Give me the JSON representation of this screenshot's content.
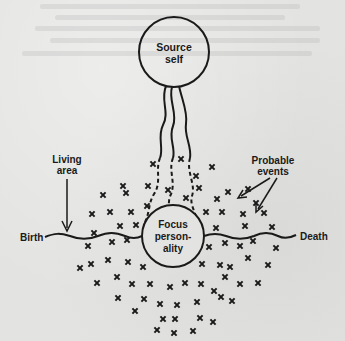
{
  "diagram": {
    "nodes": {
      "source": {
        "line1": "Source",
        "line2": "self"
      },
      "focus": {
        "line1": "Focus",
        "line2": "person-",
        "line3": "ality"
      }
    },
    "labels": {
      "living_area": {
        "line1": "Living",
        "line2": "area"
      },
      "probable_events": {
        "line1": "Probable",
        "line2": "events"
      },
      "birth": "Birth",
      "death": "Death"
    },
    "event_marker": "×",
    "colors": {
      "ink": "#1a1a1a",
      "paper": "#e3e3e1"
    },
    "event_points": [
      [
        123,
        186
      ],
      [
        153,
        164
      ],
      [
        181,
        159
      ],
      [
        196,
        176
      ],
      [
        212,
        167
      ],
      [
        103,
        195
      ],
      [
        126,
        193
      ],
      [
        148,
        186
      ],
      [
        168,
        190
      ],
      [
        199,
        188
      ],
      [
        217,
        199
      ],
      [
        228,
        192
      ],
      [
        248,
        189
      ],
      [
        92,
        214
      ],
      [
        110,
        212
      ],
      [
        131,
        212
      ],
      [
        156,
        211
      ],
      [
        186,
        198
      ],
      [
        206,
        212
      ],
      [
        222,
        212
      ],
      [
        243,
        214
      ],
      [
        256,
        203
      ],
      [
        94,
        233
      ],
      [
        120,
        226
      ],
      [
        136,
        225
      ],
      [
        147,
        206
      ],
      [
        191,
        212
      ],
      [
        216,
        228
      ],
      [
        245,
        226
      ],
      [
        264,
        213
      ],
      [
        88,
        246
      ],
      [
        112,
        242
      ],
      [
        127,
        240
      ],
      [
        209,
        247
      ],
      [
        225,
        243
      ],
      [
        240,
        246
      ],
      [
        253,
        241
      ],
      [
        272,
        227
      ],
      [
        80,
        268
      ],
      [
        91,
        264
      ],
      [
        108,
        260
      ],
      [
        128,
        262
      ],
      [
        143,
        267
      ],
      [
        202,
        264
      ],
      [
        220,
        265
      ],
      [
        230,
        267
      ],
      [
        248,
        258
      ],
      [
        268,
        265
      ],
      [
        276,
        248
      ],
      [
        97,
        283
      ],
      [
        117,
        277
      ],
      [
        132,
        284
      ],
      [
        150,
        284
      ],
      [
        170,
        287
      ],
      [
        185,
        283
      ],
      [
        201,
        284
      ],
      [
        214,
        291
      ],
      [
        225,
        277
      ],
      [
        240,
        284
      ],
      [
        258,
        283
      ],
      [
        118,
        298
      ],
      [
        144,
        299
      ],
      [
        160,
        304
      ],
      [
        177,
        305
      ],
      [
        197,
        302
      ],
      [
        221,
        297
      ],
      [
        232,
        301
      ],
      [
        135,
        311
      ],
      [
        163,
        319
      ],
      [
        175,
        319
      ],
      [
        200,
        318
      ],
      [
        213,
        322
      ],
      [
        157,
        330
      ],
      [
        174,
        333
      ],
      [
        193,
        331
      ]
    ]
  }
}
